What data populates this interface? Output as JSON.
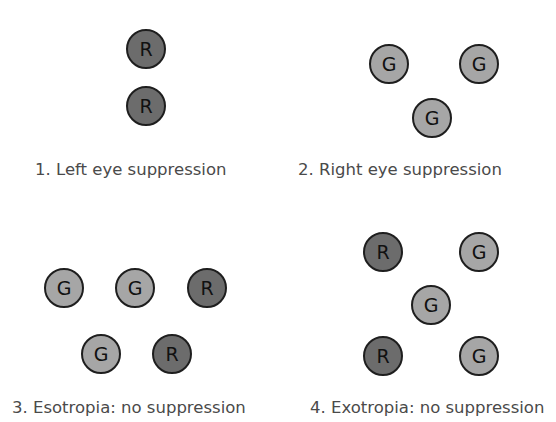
{
  "panels": [
    {
      "label": "1. Left eye suppression",
      "label_pos": [
        35,
        160
      ],
      "dots": [
        {
          "letter": "R",
          "x": 146,
          "y": 49
        },
        {
          "letter": "R",
          "x": 146,
          "y": 106
        }
      ]
    },
    {
      "label": "2. Right eye suppression",
      "label_pos": [
        298,
        160
      ],
      "dots": [
        {
          "letter": "G",
          "x": 389,
          "y": 64
        },
        {
          "letter": "G",
          "x": 479,
          "y": 64
        },
        {
          "letter": "G",
          "x": 432,
          "y": 118
        }
      ]
    },
    {
      "label": "3. Esotropia: no suppression",
      "label_pos": [
        12,
        398
      ],
      "dots": [
        {
          "letter": "G",
          "x": 64,
          "y": 288
        },
        {
          "letter": "G",
          "x": 135,
          "y": 288
        },
        {
          "letter": "R",
          "x": 207,
          "y": 288
        },
        {
          "letter": "G",
          "x": 101,
          "y": 354
        },
        {
          "letter": "R",
          "x": 172,
          "y": 354
        }
      ]
    },
    {
      "label": "4. Exotropia: no suppression",
      "label_pos": [
        310,
        398
      ],
      "dots": [
        {
          "letter": "R",
          "x": 383,
          "y": 252
        },
        {
          "letter": "G",
          "x": 479,
          "y": 252
        },
        {
          "letter": "G",
          "x": 431,
          "y": 305
        },
        {
          "letter": "R",
          "x": 383,
          "y": 356
        },
        {
          "letter": "G",
          "x": 479,
          "y": 356
        }
      ]
    }
  ],
  "colors": {
    "red_dot": "#6c6c6c",
    "green_dot": "#a6a6a6",
    "outline": "#1e1e1e",
    "label": "#4a4a4a"
  }
}
